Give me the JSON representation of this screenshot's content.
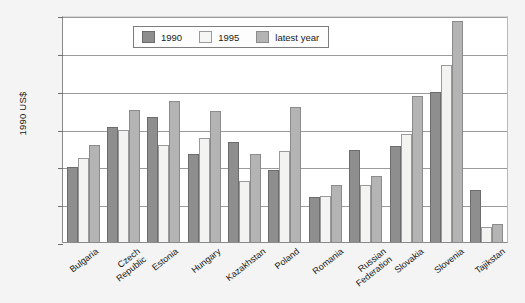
{
  "chart_data": {
    "type": "bar",
    "title": "",
    "xlabel": "",
    "ylabel": "1990 US$",
    "ylim": [
      0,
      36000
    ],
    "yticks": [
      "0",
      "6 000",
      "12 000",
      "18 000",
      "24 000",
      "30 000",
      "36 000"
    ],
    "ytick_values": [
      0,
      6000,
      12000,
      18000,
      24000,
      30000,
      36000
    ],
    "grid": true,
    "legend_position": "top-center",
    "categories": [
      "Bulgaria",
      "Czech Republic",
      "Estonia",
      "Hungary",
      "Kazakhstan",
      "Poland",
      "Romania",
      "Russian Federation",
      "Slovakia",
      "Slovenia",
      "Tajikstan"
    ],
    "category_lines": [
      [
        "Bulgaria"
      ],
      [
        "Czech",
        "Republic"
      ],
      [
        "Estonia"
      ],
      [
        "Hungary"
      ],
      [
        "Kazakhstan"
      ],
      [
        "Poland"
      ],
      [
        "Romania"
      ],
      [
        "Russian",
        "Federation"
      ],
      [
        "Slovakia"
      ],
      [
        "Slovenia"
      ],
      [
        "Tajikstan"
      ]
    ],
    "series": [
      {
        "name": "1990",
        "color": "#8e8e8e",
        "values": [
          11900,
          18200,
          19800,
          13900,
          15900,
          11500,
          7100,
          14600,
          15200,
          23800,
          8200
        ]
      },
      {
        "name": "1995",
        "color": "#f3f3f1",
        "values": [
          13300,
          17800,
          15400,
          16500,
          9700,
          14400,
          7300,
          9000,
          17200,
          28000,
          2400
        ]
      },
      {
        "name": "latest year",
        "color": "#b4b4b4",
        "values": [
          15400,
          21000,
          22400,
          20800,
          14000,
          21400,
          9100,
          10400,
          23200,
          35000,
          2800
        ]
      }
    ]
  }
}
